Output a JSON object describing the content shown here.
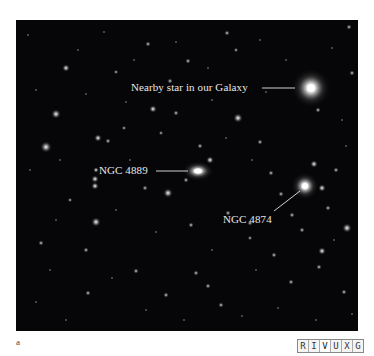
{
  "figure": {
    "panel_letter": "a",
    "labels": {
      "star": "Nearby star in our Galaxy",
      "ngc4889": "NGC 4889",
      "ngc4874": "NGC 4874"
    },
    "wavelength_bar": {
      "bands": [
        "R",
        "I",
        "V",
        "U",
        "X",
        "G"
      ],
      "active": "V"
    }
  }
}
